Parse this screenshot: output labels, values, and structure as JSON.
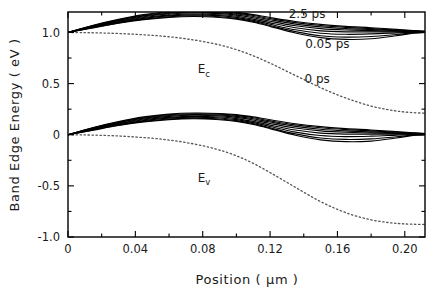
{
  "chart_data": {
    "type": "line",
    "title": "",
    "xlabel": "Position ( μm )",
    "ylabel": "Band Edge Energy ( eV )",
    "xlim": [
      0,
      0.212
    ],
    "ylim": [
      -1.0,
      1.2
    ],
    "grid": false,
    "legend_position": "inline-annotations",
    "x_ticks": [
      {
        "value": 0,
        "label": "0"
      },
      {
        "value": 0.04,
        "label": "0.04"
      },
      {
        "value": 0.08,
        "label": "0.08"
      },
      {
        "value": 0.12,
        "label": "0.12"
      },
      {
        "value": 0.16,
        "label": "0.16"
      },
      {
        "value": 0.2,
        "label": "0.20"
      }
    ],
    "x_minor_ticks": [
      0.02,
      0.06,
      0.1,
      0.14,
      0.18
    ],
    "y_ticks": [
      {
        "value": 1.0,
        "label": "1.0"
      },
      {
        "value": 0.5,
        "label": "0.5"
      },
      {
        "value": 0.0,
        "label": "0"
      },
      {
        "value": -0.5,
        "label": "-0.5"
      },
      {
        "value": -1.0,
        "label": "-1.0"
      }
    ],
    "y_minor_ticks": [
      1.25,
      0.75,
      0.25,
      -0.25,
      -0.75
    ],
    "annotations": [
      {
        "name": "time-label-2p5ps",
        "text": "2.5 ps",
        "x": 0.142,
        "y": 1.145
      },
      {
        "name": "time-label-0p05ps",
        "text": "0.05 ps",
        "x": 0.154,
        "y": 0.845
      },
      {
        "name": "time-label-0ps",
        "text": "0 ps",
        "x": 0.148,
        "y": 0.51
      },
      {
        "name": "band-label-ec",
        "text": "E",
        "sub": "c",
        "x": 0.077,
        "y": 0.6
      },
      {
        "name": "band-label-ev",
        "text": "E",
        "sub": "v",
        "x": 0.077,
        "y": -0.46
      }
    ],
    "series": [
      {
        "name": "Ec equilibrium (0 ps)",
        "band": "conduction",
        "style": "dotted",
        "time_ps": 0,
        "x": [
          0.0,
          0.01,
          0.02,
          0.03,
          0.04,
          0.05,
          0.06,
          0.07,
          0.08,
          0.09,
          0.1,
          0.11,
          0.12,
          0.13,
          0.14,
          0.15,
          0.16,
          0.17,
          0.18,
          0.19,
          0.2,
          0.212
        ],
        "y": [
          1.0,
          0.998,
          0.995,
          0.99,
          0.982,
          0.972,
          0.958,
          0.938,
          0.912,
          0.878,
          0.832,
          0.772,
          0.7,
          0.62,
          0.54,
          0.46,
          0.39,
          0.33,
          0.28,
          0.245,
          0.222,
          0.21
        ]
      },
      {
        "name": "Ev equilibrium (0 ps)",
        "band": "valence",
        "style": "dotted",
        "time_ps": 0,
        "x": [
          0.0,
          0.01,
          0.02,
          0.03,
          0.04,
          0.05,
          0.06,
          0.07,
          0.08,
          0.09,
          0.1,
          0.11,
          0.12,
          0.13,
          0.14,
          0.15,
          0.16,
          0.17,
          0.18,
          0.19,
          0.2,
          0.212
        ],
        "y": [
          0.0,
          -0.002,
          -0.006,
          -0.012,
          -0.022,
          -0.034,
          -0.052,
          -0.076,
          -0.108,
          -0.15,
          -0.206,
          -0.28,
          -0.37,
          -0.466,
          -0.562,
          -0.654,
          -0.73,
          -0.79,
          -0.832,
          -0.858,
          -0.872,
          -0.878
        ]
      },
      {
        "name": "conduction 0.05 ps",
        "band": "conduction",
        "style": "solid",
        "time_ps": 0.05,
        "x": [
          0.0,
          0.015,
          0.03,
          0.045,
          0.06,
          0.075,
          0.09,
          0.1,
          0.11,
          0.12,
          0.135,
          0.15,
          0.165,
          0.18,
          0.195,
          0.205,
          0.212
        ],
        "y": [
          1.0,
          1.045,
          1.09,
          1.125,
          1.148,
          1.156,
          1.146,
          1.13,
          1.1,
          1.06,
          0.995,
          0.95,
          0.932,
          0.938,
          0.968,
          0.992,
          1.0
        ]
      },
      {
        "name": "conduction 0.1 ps",
        "band": "conduction",
        "style": "solid",
        "time_ps": 0.1,
        "x": [
          0.0,
          0.015,
          0.03,
          0.045,
          0.06,
          0.075,
          0.09,
          0.1,
          0.11,
          0.12,
          0.135,
          0.15,
          0.165,
          0.18,
          0.195,
          0.205,
          0.212
        ],
        "y": [
          1.0,
          1.048,
          1.094,
          1.13,
          1.154,
          1.163,
          1.154,
          1.138,
          1.108,
          1.068,
          1.008,
          0.968,
          0.954,
          0.96,
          0.98,
          0.996,
          1.001
        ]
      },
      {
        "name": "conduction 0.2 ps",
        "band": "conduction",
        "style": "solid",
        "time_ps": 0.2,
        "x": [
          0.0,
          0.015,
          0.03,
          0.045,
          0.06,
          0.075,
          0.09,
          0.1,
          0.11,
          0.12,
          0.135,
          0.15,
          0.165,
          0.18,
          0.195,
          0.205,
          0.212
        ],
        "y": [
          1.0,
          1.052,
          1.1,
          1.138,
          1.162,
          1.172,
          1.164,
          1.148,
          1.118,
          1.08,
          1.026,
          0.992,
          0.982,
          0.986,
          0.996,
          1.002,
          1.003
        ]
      },
      {
        "name": "conduction 0.4 ps",
        "band": "conduction",
        "style": "solid",
        "time_ps": 0.4,
        "x": [
          0.0,
          0.015,
          0.03,
          0.045,
          0.06,
          0.075,
          0.09,
          0.1,
          0.11,
          0.12,
          0.135,
          0.15,
          0.165,
          0.18,
          0.195,
          0.205,
          0.212
        ],
        "y": [
          1.0,
          1.056,
          1.106,
          1.146,
          1.17,
          1.18,
          1.173,
          1.158,
          1.13,
          1.094,
          1.046,
          1.016,
          1.006,
          1.006,
          1.006,
          1.005,
          1.004
        ]
      },
      {
        "name": "conduction 0.8 ps",
        "band": "conduction",
        "style": "solid",
        "time_ps": 0.8,
        "x": [
          0.0,
          0.015,
          0.03,
          0.045,
          0.06,
          0.075,
          0.09,
          0.1,
          0.11,
          0.12,
          0.135,
          0.15,
          0.165,
          0.18,
          0.195,
          0.205,
          0.212
        ],
        "y": [
          1.0,
          1.06,
          1.112,
          1.154,
          1.18,
          1.19,
          1.184,
          1.17,
          1.144,
          1.11,
          1.066,
          1.038,
          1.024,
          1.018,
          1.012,
          1.008,
          1.006
        ]
      },
      {
        "name": "conduction 1.2 ps",
        "band": "conduction",
        "style": "solid",
        "time_ps": 1.2,
        "x": [
          0.0,
          0.015,
          0.03,
          0.045,
          0.06,
          0.075,
          0.09,
          0.1,
          0.11,
          0.12,
          0.135,
          0.15,
          0.165,
          0.18,
          0.195,
          0.205,
          0.212
        ],
        "y": [
          1.0,
          1.064,
          1.118,
          1.162,
          1.188,
          1.198,
          1.193,
          1.18,
          1.156,
          1.124,
          1.082,
          1.054,
          1.038,
          1.028,
          1.018,
          1.012,
          1.008
        ]
      },
      {
        "name": "conduction 1.8 ps",
        "band": "conduction",
        "style": "solid",
        "time_ps": 1.8,
        "x": [
          0.0,
          0.015,
          0.03,
          0.045,
          0.06,
          0.075,
          0.09,
          0.1,
          0.11,
          0.12,
          0.135,
          0.15,
          0.165,
          0.18,
          0.195,
          0.205,
          0.212
        ],
        "y": [
          1.0,
          1.067,
          1.123,
          1.168,
          1.195,
          1.205,
          1.201,
          1.189,
          1.166,
          1.136,
          1.096,
          1.068,
          1.05,
          1.038,
          1.024,
          1.016,
          1.01
        ]
      },
      {
        "name": "conduction 2.5 ps",
        "band": "conduction",
        "style": "solid",
        "time_ps": 2.5,
        "x": [
          0.0,
          0.015,
          0.03,
          0.045,
          0.06,
          0.075,
          0.09,
          0.1,
          0.11,
          0.12,
          0.135,
          0.15,
          0.165,
          0.18,
          0.195,
          0.205,
          0.212
        ],
        "y": [
          1.0,
          1.07,
          1.128,
          1.174,
          1.202,
          1.212,
          1.208,
          1.197,
          1.175,
          1.146,
          1.107,
          1.079,
          1.06,
          1.046,
          1.03,
          1.019,
          1.012
        ]
      },
      {
        "name": "valence 0.05 ps",
        "band": "valence",
        "style": "solid",
        "time_ps": 0.05,
        "x": [
          0.0,
          0.015,
          0.03,
          0.045,
          0.06,
          0.075,
          0.09,
          0.1,
          0.11,
          0.12,
          0.135,
          0.15,
          0.165,
          0.18,
          0.195,
          0.205,
          0.212
        ],
        "y": [
          0.0,
          0.045,
          0.09,
          0.125,
          0.148,
          0.156,
          0.146,
          0.13,
          0.1,
          0.06,
          -0.005,
          -0.05,
          -0.068,
          -0.062,
          -0.032,
          -0.008,
          0.0
        ]
      },
      {
        "name": "valence 0.1 ps",
        "band": "valence",
        "style": "solid",
        "time_ps": 0.1,
        "x": [
          0.0,
          0.015,
          0.03,
          0.045,
          0.06,
          0.075,
          0.09,
          0.1,
          0.11,
          0.12,
          0.135,
          0.15,
          0.165,
          0.18,
          0.195,
          0.205,
          0.212
        ],
        "y": [
          0.0,
          0.048,
          0.094,
          0.13,
          0.154,
          0.163,
          0.154,
          0.138,
          0.108,
          0.068,
          0.008,
          -0.032,
          -0.046,
          -0.04,
          -0.02,
          -0.004,
          0.001
        ]
      },
      {
        "name": "valence 0.2 ps",
        "band": "valence",
        "style": "solid",
        "time_ps": 0.2,
        "x": [
          0.0,
          0.015,
          0.03,
          0.045,
          0.06,
          0.075,
          0.09,
          0.1,
          0.11,
          0.12,
          0.135,
          0.15,
          0.165,
          0.18,
          0.195,
          0.205,
          0.212
        ],
        "y": [
          0.0,
          0.052,
          0.1,
          0.138,
          0.162,
          0.172,
          0.164,
          0.148,
          0.118,
          0.08,
          0.026,
          -0.008,
          -0.018,
          -0.014,
          -0.004,
          0.002,
          0.003
        ]
      },
      {
        "name": "valence 0.4 ps",
        "band": "valence",
        "style": "solid",
        "time_ps": 0.4,
        "x": [
          0.0,
          0.015,
          0.03,
          0.045,
          0.06,
          0.075,
          0.09,
          0.1,
          0.11,
          0.12,
          0.135,
          0.15,
          0.165,
          0.18,
          0.195,
          0.205,
          0.212
        ],
        "y": [
          0.0,
          0.056,
          0.106,
          0.146,
          0.17,
          0.18,
          0.173,
          0.158,
          0.13,
          0.094,
          0.046,
          0.016,
          0.006,
          0.006,
          0.006,
          0.005,
          0.004
        ]
      },
      {
        "name": "valence 0.8 ps",
        "band": "valence",
        "style": "solid",
        "time_ps": 0.8,
        "x": [
          0.0,
          0.015,
          0.03,
          0.045,
          0.06,
          0.075,
          0.09,
          0.1,
          0.11,
          0.12,
          0.135,
          0.15,
          0.165,
          0.18,
          0.195,
          0.205,
          0.212
        ],
        "y": [
          0.0,
          0.06,
          0.112,
          0.154,
          0.18,
          0.19,
          0.184,
          0.17,
          0.144,
          0.11,
          0.066,
          0.038,
          0.024,
          0.018,
          0.012,
          0.008,
          0.006
        ]
      },
      {
        "name": "valence 1.2 ps",
        "band": "valence",
        "style": "solid",
        "time_ps": 1.2,
        "x": [
          0.0,
          0.015,
          0.03,
          0.045,
          0.06,
          0.075,
          0.09,
          0.1,
          0.11,
          0.12,
          0.135,
          0.15,
          0.165,
          0.18,
          0.195,
          0.205,
          0.212
        ],
        "y": [
          0.0,
          0.064,
          0.118,
          0.162,
          0.188,
          0.198,
          0.193,
          0.18,
          0.156,
          0.124,
          0.082,
          0.054,
          0.038,
          0.028,
          0.018,
          0.012,
          0.008
        ]
      },
      {
        "name": "valence 1.8 ps",
        "band": "valence",
        "style": "solid",
        "time_ps": 1.8,
        "x": [
          0.0,
          0.015,
          0.03,
          0.045,
          0.06,
          0.075,
          0.09,
          0.1,
          0.11,
          0.12,
          0.135,
          0.15,
          0.165,
          0.18,
          0.195,
          0.205,
          0.212
        ],
        "y": [
          0.0,
          0.067,
          0.123,
          0.168,
          0.195,
          0.205,
          0.201,
          0.189,
          0.166,
          0.136,
          0.096,
          0.068,
          0.05,
          0.038,
          0.024,
          0.016,
          0.01
        ]
      },
      {
        "name": "valence 2.5 ps",
        "band": "valence",
        "style": "solid",
        "time_ps": 2.5,
        "x": [
          0.0,
          0.015,
          0.03,
          0.045,
          0.06,
          0.075,
          0.09,
          0.1,
          0.11,
          0.12,
          0.135,
          0.15,
          0.165,
          0.18,
          0.195,
          0.205,
          0.212
        ],
        "y": [
          0.0,
          0.07,
          0.128,
          0.174,
          0.202,
          0.212,
          0.208,
          0.197,
          0.175,
          0.146,
          0.107,
          0.079,
          0.06,
          0.046,
          0.03,
          0.019,
          0.012
        ]
      }
    ],
    "colors": {
      "axis": "#000000",
      "solid_curve": "#000000",
      "dotted_curve": "#555555",
      "background": "#ffffff"
    }
  }
}
